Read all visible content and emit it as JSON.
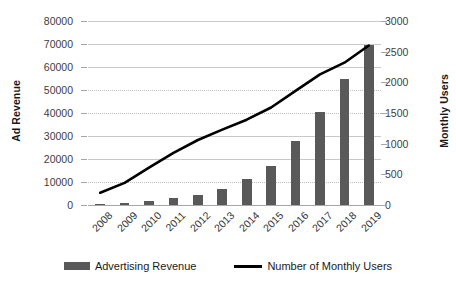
{
  "chart_data": {
    "type": "bar",
    "title": "",
    "xlabel": "",
    "ylabel": "Ad Revenue",
    "y2label": "Monthly Users",
    "categories": [
      "2008",
      "2009",
      "2010",
      "2011",
      "2012",
      "2013",
      "2014",
      "2015",
      "2016",
      "2017",
      "2018",
      "2019"
    ],
    "ylim": [
      0,
      80000
    ],
    "y2lim": [
      0,
      3000
    ],
    "yticks": [
      0,
      10000,
      20000,
      30000,
      40000,
      50000,
      60000,
      70000,
      80000
    ],
    "ytick_labels": [
      "0",
      "10000",
      "20000",
      "30000",
      "40000",
      "50000",
      "60000",
      "70000",
      "80000"
    ],
    "y2ticks": [
      0,
      500,
      1000,
      1500,
      2000,
      2500,
      3000
    ],
    "y2tick_labels": [
      "0",
      "500",
      "1000",
      "1500",
      "2000",
      "2500",
      "3000"
    ],
    "grid": true,
    "legend_position": "bottom",
    "series": [
      {
        "name": "Advertising Revenue",
        "type": "bar",
        "axis": "left",
        "color": "#595959",
        "values": [
          150,
          750,
          1970,
          3150,
          4280,
          6990,
          11490,
          17080,
          27640,
          40650,
          55010,
          69660
        ]
      },
      {
        "name": "Number of Monthly Users",
        "type": "line",
        "axis": "right",
        "color": "#000000",
        "values": [
          200,
          360,
          610,
          850,
          1060,
          1230,
          1390,
          1590,
          1860,
          2130,
          2320,
          2600
        ]
      }
    ]
  },
  "legend": {
    "items": [
      {
        "label": "Advertising Revenue",
        "marker": "bar-swatch"
      },
      {
        "label": "Number of Monthly Users",
        "marker": "line-swatch"
      }
    ]
  }
}
